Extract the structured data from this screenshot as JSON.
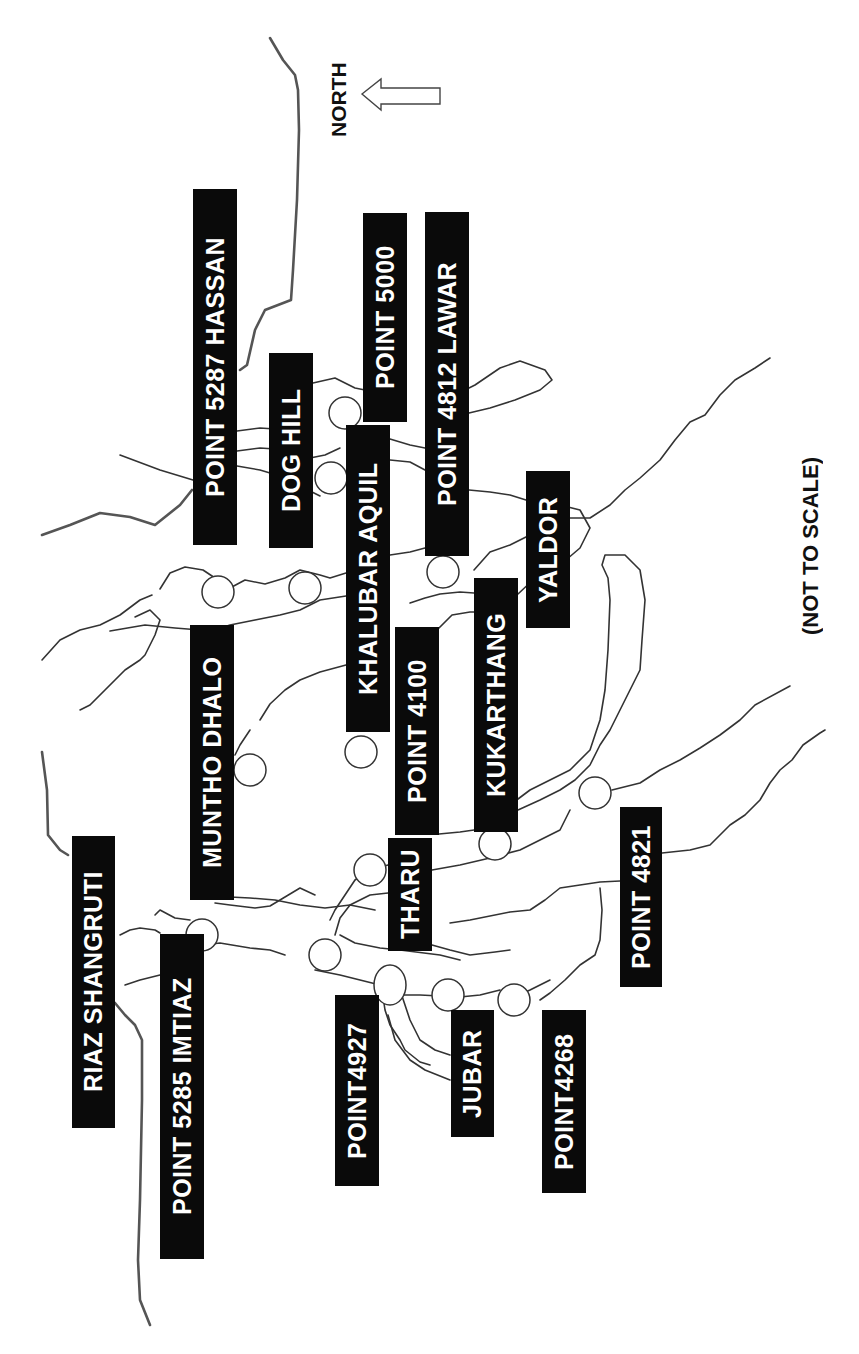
{
  "map": {
    "orientation_note": "NORTH",
    "scale_note": "(NOT TO SCALE)",
    "colors": {
      "label_bg": "#0a0a0a",
      "label_text": "#ffffff",
      "lines": "#333333",
      "background": "#ffffff"
    }
  },
  "labels": [
    {
      "id": "point-5287-hassan",
      "text": "POINT 5287 HASSAN"
    },
    {
      "id": "dog-hill",
      "text": "DOG HILL"
    },
    {
      "id": "point-5000",
      "text": "POINT 5000"
    },
    {
      "id": "khalubar-aquil",
      "text": "KHALUBAR AQUIL"
    },
    {
      "id": "point-4812-lawar",
      "text": "POINT 4812 LAWAR"
    },
    {
      "id": "yaldor",
      "text": "YALDOR"
    },
    {
      "id": "kukarthang",
      "text": "KUKARTHANG"
    },
    {
      "id": "point-4100",
      "text": "POINT 4100"
    },
    {
      "id": "tharu",
      "text": "THARU"
    },
    {
      "id": "muntho-dhalo",
      "text": "MUNTHO DHALO"
    },
    {
      "id": "riaz-shangruti",
      "text": "RIAZ SHANGRUTI"
    },
    {
      "id": "point-5285-imtiaz",
      "text": "POINT 5285 IMTIAZ"
    },
    {
      "id": "point4927",
      "text": "POINT4927"
    },
    {
      "id": "jubar",
      "text": "JUBAR"
    },
    {
      "id": "point4268",
      "text": "POINT4268"
    },
    {
      "id": "point-4821",
      "text": "POINT 4821"
    }
  ]
}
